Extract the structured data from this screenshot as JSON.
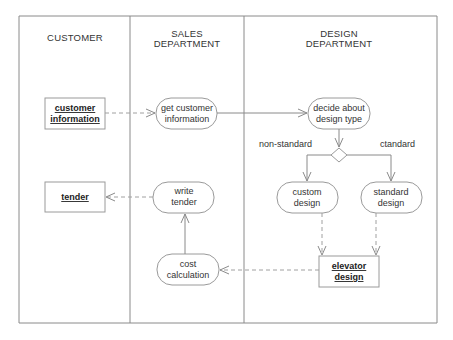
{
  "diagram": {
    "type": "UML activity diagram with swimlanes",
    "lanes": [
      {
        "id": "customer",
        "title_line1": "CUSTOMER",
        "title_line2": ""
      },
      {
        "id": "sales",
        "title_line1": "SALES",
        "title_line2": "DEPARTMENT"
      },
      {
        "id": "design",
        "title_line1": "DESIGN",
        "title_line2": "DEPARTMENT"
      }
    ],
    "objects": {
      "customer_information": {
        "line1": "customer",
        "line2": "information"
      },
      "tender": {
        "line1": "tender"
      },
      "elevator_design": {
        "line1": "elevator",
        "line2": "design"
      }
    },
    "activities": {
      "get_customer_information": {
        "line1": "get customer",
        "line2": "information"
      },
      "write_tender": {
        "line1": "write",
        "line2": "tender"
      },
      "cost_calculation": {
        "line1": "cost",
        "line2": "calculation"
      },
      "decide_design_type": {
        "line1": "decide  about",
        "line2": "design type"
      },
      "custom_design": {
        "line1": "custom",
        "line2": "design"
      },
      "standard_design": {
        "line1": "standard",
        "line2": "design"
      }
    },
    "guards": {
      "non_standard": "non-standard",
      "standard": "ctandard"
    },
    "colors": {
      "line": "#8a8a8a",
      "text": "#333333",
      "background": "#ffffff"
    }
  }
}
